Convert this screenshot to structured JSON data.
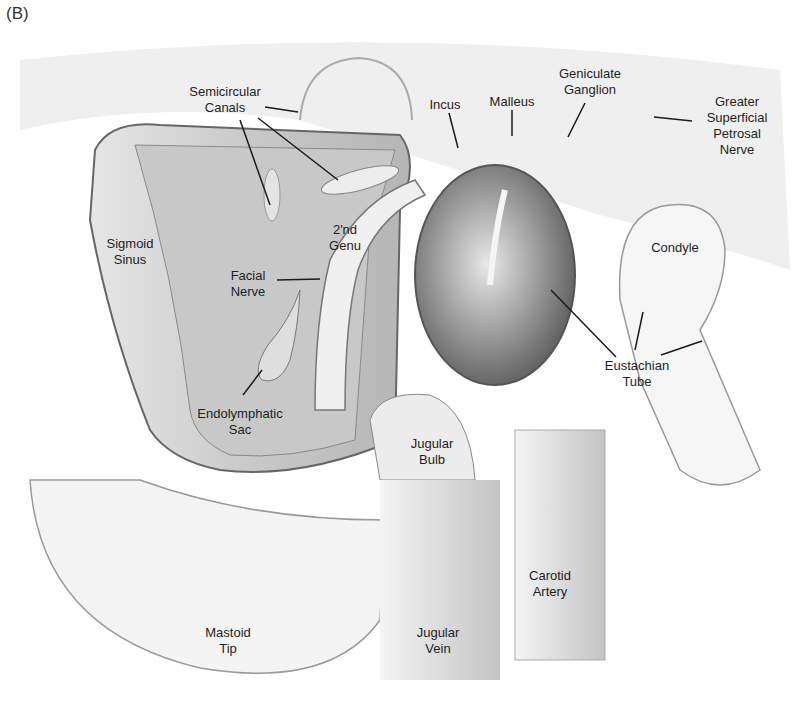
{
  "figure": {
    "panel_label": "(B)",
    "colors": {
      "background": "#ffffff",
      "bone_light": "#f2f2f2",
      "bone_mid": "#d9d9d9",
      "cavity_dark": "#8a8a8a",
      "outline": "#777777",
      "leader_line": "#1a1a1a",
      "text": "#1e1e1e"
    }
  },
  "labels": [
    {
      "id": "semicircular-canals",
      "text": "Semicircular\nCanals",
      "x": 225,
      "y": 84
    },
    {
      "id": "incus",
      "text": "Incus",
      "x": 445,
      "y": 97
    },
    {
      "id": "malleus",
      "text": "Malleus",
      "x": 512,
      "y": 94
    },
    {
      "id": "geniculate-ganglion",
      "text": "Geniculate\nGanglion",
      "x": 590,
      "y": 66
    },
    {
      "id": "greater-superficial-petrosal-nerve",
      "text": "Greater\nSuperficial\nPetrosal\nNerve",
      "x": 737,
      "y": 94
    },
    {
      "id": "sigmoid-sinus",
      "text": "Sigmoid\nSinus",
      "x": 130,
      "y": 236
    },
    {
      "id": "second-genu",
      "text": "2'nd\nGenu",
      "x": 345,
      "y": 222
    },
    {
      "id": "facial-nerve",
      "text": "Facial\nNerve",
      "x": 248,
      "y": 268
    },
    {
      "id": "condyle",
      "text": "Condyle",
      "x": 675,
      "y": 240
    },
    {
      "id": "endolymphatic-sac",
      "text": "Endolymphatic\nSac",
      "x": 240,
      "y": 406
    },
    {
      "id": "eustachian-tube",
      "text": "Eustachian\nTube",
      "x": 637,
      "y": 358
    },
    {
      "id": "jugular-bulb",
      "text": "Jugular\nBulb",
      "x": 432,
      "y": 436
    },
    {
      "id": "carotid-artery",
      "text": "Carotid\nArtery",
      "x": 550,
      "y": 568
    },
    {
      "id": "mastoid-tip",
      "text": "Mastoid\nTip",
      "x": 228,
      "y": 625
    },
    {
      "id": "jugular-vein",
      "text": "Jugular\nVein",
      "x": 438,
      "y": 625
    }
  ]
}
